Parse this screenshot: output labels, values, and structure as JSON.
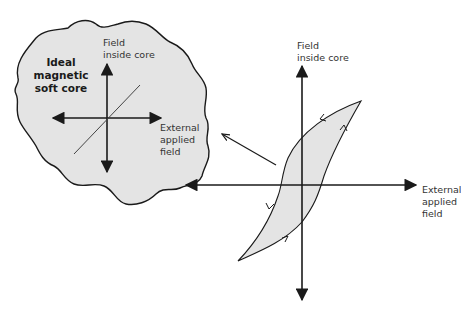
{
  "colors": {
    "fill": "#e4e4e4",
    "stroke": "#1a1a1a",
    "text": "#333333",
    "background": "#ffffff"
  },
  "inset": {
    "title": "Ideal\nmagnetic\nsoft core",
    "y_axis_label": "Field\ninside core",
    "x_axis_label": "External\napplied\nfield",
    "curve": "linear-through-origin"
  },
  "main": {
    "y_axis_label": "Field\ninside core",
    "x_axis_label": "External\napplied\nfield",
    "curve": "hysteresis-loop",
    "loop_direction_arrows": 4
  },
  "pointer": {
    "from": "hysteresis-loop",
    "to": "ideal-soft-core-inset"
  }
}
